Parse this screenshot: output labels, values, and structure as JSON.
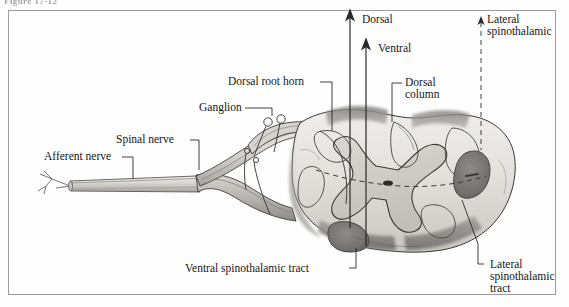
{
  "figure": {
    "caption": "Figure 17-12"
  },
  "labels": {
    "afferent_nerve": "Afferent nerve",
    "spinal_nerve": "Spinal nerve",
    "ganglion": "Ganglion",
    "dorsal_root_horn": "Dorsal root horn",
    "dorsal_column_line1": "Dorsal",
    "dorsal_column_line2": "column",
    "dorsal_arrow": "Dorsal",
    "ventral_arrow": "Ventral",
    "lateral_spinothalamic_top_line1": "Lateral",
    "lateral_spinothalamic_top_line2": "spinothalamic",
    "ventral_spinothalamic_tract": "Ventral spinothalamic tract",
    "lateral_spinothalamic_bottom_line1": "Lateral",
    "lateral_spinothalamic_bottom_line2": "spinothalamic",
    "lateral_spinothalamic_bottom_line3": "tract"
  },
  "colors": {
    "page_background": "#fefefe",
    "frame_border": "#9a9a9a",
    "text": "#161616",
    "caption_text": "#5d5d5d",
    "white_matter_light": "#e9e7e4",
    "white_matter_mid": "#d2cfca",
    "gray_matter": "#c8c5c0",
    "tract_dark": "#7e7c79",
    "tract_darker": "#676564",
    "nerve_light": "#ddd9d4",
    "nerve_shadow": "#a9a6a2",
    "outline": "#3b3a38",
    "leader_line": "#2a2a2a"
  },
  "anatomy": {
    "structures": [
      "spinal cord cross-section",
      "dorsal root ganglion with two cell bodies",
      "spinal nerve trunk",
      "afferent nerve with free nerve ending",
      "dorsal column",
      "dorsal root horn",
      "ventral spinothalamic tract",
      "lateral spinothalamic tract",
      "central canal"
    ],
    "arrows": [
      "dorsal ascending arrow",
      "ventral ascending arrow"
    ],
    "dashed_elements": [
      "lateral spinothalamic leader",
      "decussation pathway"
    ]
  }
}
